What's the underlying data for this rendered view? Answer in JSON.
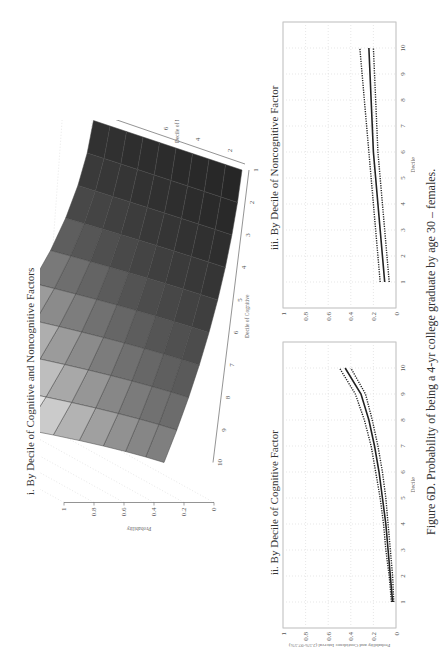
{
  "caption": "Figure 6D.  Probability of being a 4-yr college graduate by age 30 – females.",
  "chart_data": [
    {
      "id": "i",
      "type": "surface3d",
      "title": "i. By Decile of Cognitive and Noncognitive Factors",
      "xlabel": "Decile of Cognitive",
      "ylabel": "Decile of Noncognitive",
      "zlabel": "Probability",
      "x_ticks": [
        "1",
        "2",
        "3",
        "4",
        "5",
        "6",
        "7",
        "8",
        "9",
        "10"
      ],
      "y_ticks": [
        "2",
        "4",
        "6",
        "8",
        "10"
      ],
      "z_ticks": [
        "0",
        "0.2",
        "0.4",
        "0.6",
        "0.8",
        "1"
      ],
      "zlim": [
        0,
        1
      ],
      "grid": true,
      "corner_values": {
        "cog1_noncog1": 0.02,
        "cog10_noncog1": 0.3,
        "cog1_noncog10": 0.05,
        "cog10_noncog10": 0.85
      }
    },
    {
      "id": "ii",
      "type": "line",
      "title": "ii. By Decile of Cognitive Factor",
      "xlabel": "Decile",
      "ylabel": "Probability and Confidence Interval (2.5%-97.5%)",
      "x": [
        1,
        2,
        3,
        4,
        5,
        6,
        7,
        8,
        9,
        10
      ],
      "series": [
        {
          "name": "Probability",
          "style": "solid",
          "values": [
            0.03,
            0.05,
            0.07,
            0.09,
            0.12,
            0.15,
            0.19,
            0.24,
            0.31,
            0.45
          ]
        },
        {
          "name": "Lower 2.5%",
          "style": "dotted",
          "values": [
            0.02,
            0.03,
            0.05,
            0.07,
            0.09,
            0.12,
            0.16,
            0.21,
            0.27,
            0.4
          ]
        },
        {
          "name": "Upper 97.5%",
          "style": "dotted",
          "values": [
            0.04,
            0.06,
            0.09,
            0.11,
            0.14,
            0.18,
            0.22,
            0.28,
            0.36,
            0.5
          ]
        }
      ],
      "ylim": [
        0,
        1
      ],
      "xlim": [
        0,
        11
      ],
      "y_ticks": [
        "0",
        "0.2",
        "0.4",
        "0.6",
        "0.8",
        "1"
      ],
      "x_ticks": [
        "1",
        "2",
        "3",
        "4",
        "5",
        "6",
        "7",
        "8",
        "9",
        "10"
      ],
      "grid": true
    },
    {
      "id": "iii",
      "type": "line",
      "title": "iii. By Decile of Noncognitive Factor",
      "xlabel": "Decile",
      "ylabel": "",
      "x": [
        1,
        2,
        3,
        4,
        5,
        6,
        7,
        8,
        9,
        10
      ],
      "series": [
        {
          "name": "Probability",
          "style": "solid",
          "values": [
            0.1,
            0.12,
            0.14,
            0.16,
            0.18,
            0.2,
            0.21,
            0.22,
            0.23,
            0.24
          ]
        },
        {
          "name": "Lower 2.5%",
          "style": "dotted",
          "values": [
            0.06,
            0.08,
            0.1,
            0.12,
            0.14,
            0.16,
            0.17,
            0.18,
            0.19,
            0.2
          ]
        },
        {
          "name": "Upper 97.5%",
          "style": "dotted",
          "values": [
            0.14,
            0.16,
            0.18,
            0.2,
            0.22,
            0.24,
            0.26,
            0.28,
            0.3,
            0.32
          ]
        }
      ],
      "ylim": [
        0,
        1
      ],
      "xlim": [
        0,
        11
      ],
      "y_ticks": [
        "0",
        "0.2",
        "0.4",
        "0.6",
        "0.8",
        "1"
      ],
      "x_ticks": [
        "1",
        "2",
        "3",
        "4",
        "5",
        "6",
        "7",
        "8",
        "9",
        "10"
      ],
      "grid": true
    }
  ]
}
